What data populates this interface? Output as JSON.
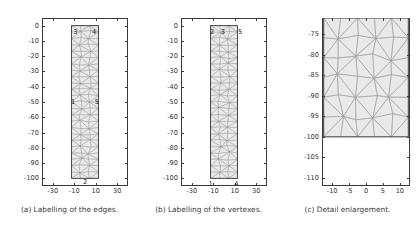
{
  "figure": {
    "background": "#ffffff",
    "mesh_fill": "#e9e9e9",
    "mesh_line": "#9a9a9a",
    "axis_color": "#3a3a3a"
  },
  "panels": [
    {
      "id": "a",
      "caption": "(a) Labelling of the edges.",
      "xticks": [
        "-30",
        "-10",
        "10",
        "30"
      ],
      "xtick_values": [
        -30,
        -10,
        10,
        30
      ],
      "yticks": [
        "0",
        "-10",
        "-20",
        "-30",
        "-40",
        "-50",
        "-60",
        "-70",
        "-80",
        "-90",
        "-100"
      ],
      "ytick_values": [
        0,
        -10,
        -20,
        -30,
        -40,
        -50,
        -60,
        -70,
        -80,
        -90,
        -100
      ],
      "xlim": [
        -40,
        40
      ],
      "ylim": [
        -105,
        5
      ],
      "rect": {
        "x0": -12.5,
        "x1": 12.5,
        "y0": -100,
        "y1": 0
      },
      "labels": [
        {
          "text": "3",
          "x": -9.0,
          "y": -4.0
        },
        {
          "text": "4",
          "x": 8.5,
          "y": -4.0
        },
        {
          "text": "1",
          "x": -11.0,
          "y": -50.0
        },
        {
          "text": "5",
          "x": 11.0,
          "y": -50.0
        },
        {
          "text": "2",
          "x": 0.0,
          "y": -102.5
        }
      ]
    },
    {
      "id": "b",
      "caption": "(b) Labelling of the vertexes.",
      "xticks": [
        "-30",
        "-10",
        "10",
        "30"
      ],
      "xtick_values": [
        -30,
        -10,
        10,
        30
      ],
      "yticks": [
        "0",
        "-10",
        "-20",
        "-30",
        "-40",
        "-50",
        "-60",
        "-70",
        "-80",
        "-90",
        "-100"
      ],
      "ytick_values": [
        0,
        -10,
        -20,
        -30,
        -40,
        -50,
        -60,
        -70,
        -80,
        -90,
        -100
      ],
      "xlim": [
        -40,
        40
      ],
      "ylim": [
        -105,
        5
      ],
      "rect": {
        "x0": -12.5,
        "x1": 12.5,
        "y0": -100,
        "y1": 0
      },
      "labels": [
        {
          "text": "2",
          "x": -11.0,
          "y": -4.0
        },
        {
          "text": "3",
          "x": -1.0,
          "y": -4.0
        },
        {
          "text": "5",
          "x": 15.0,
          "y": -4.0
        },
        {
          "text": "1",
          "x": -12.5,
          "y": -103.5
        },
        {
          "text": "4",
          "x": 11.5,
          "y": -103.5
        }
      ]
    },
    {
      "id": "c",
      "caption": "(c) Detail enlargement.",
      "xticks": [
        "-10",
        "-5",
        "0",
        "5",
        "10"
      ],
      "xtick_values": [
        -10,
        -5,
        0,
        5,
        10
      ],
      "yticks": [
        "-75",
        "-80",
        "-85",
        "-90",
        "-95",
        "-100",
        "-105",
        "-110"
      ],
      "ytick_values": [
        -75,
        -80,
        -85,
        -90,
        -95,
        -100,
        -105,
        -110
      ],
      "xlim": [
        -13,
        13
      ],
      "ylim": [
        -112,
        -71
      ],
      "rect": {
        "x0": -12.5,
        "x1": 12.5,
        "y0": -100,
        "y1": -71
      },
      "labels": []
    }
  ],
  "chart_data": {
    "type": "diagram",
    "subplots": [
      {
        "name": "Labelling of the edges",
        "edge_labels": [
          {
            "id": "1",
            "location": "left edge, mid-height"
          },
          {
            "id": "2",
            "location": "bottom edge, centre"
          },
          {
            "id": "3",
            "location": "top edge, left"
          },
          {
            "id": "4",
            "location": "top edge, right"
          },
          {
            "id": "5",
            "location": "right edge, mid-height"
          }
        ]
      },
      {
        "name": "Labelling of the vertexes",
        "vertex_labels": [
          {
            "id": "1",
            "x": -12.5,
            "y": -100
          },
          {
            "id": "2",
            "x": -12.5,
            "y": 0
          },
          {
            "id": "3",
            "x": 0,
            "y": 0
          },
          {
            "id": "4",
            "x": 12.5,
            "y": -100
          },
          {
            "id": "5",
            "x": 12.5,
            "y": 0
          }
        ]
      },
      {
        "name": "Detail enlargement",
        "region": {
          "xlim": [
            -13,
            13
          ],
          "ylim": [
            -112,
            -71
          ]
        }
      }
    ]
  }
}
